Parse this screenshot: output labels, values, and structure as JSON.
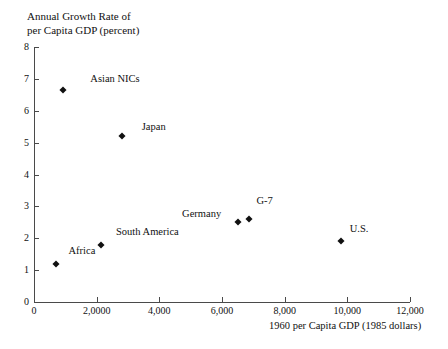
{
  "chart_data": {
    "type": "scatter",
    "title": "",
    "xlabel": "1960 per Capita GDP (1985 dollars)",
    "ylabel": "Annual Growth Rate of\nper Capita GDP (percent)",
    "xlim": [
      0,
      12000
    ],
    "ylim": [
      0,
      8
    ],
    "grid": false,
    "legend": "none",
    "xticks": [
      {
        "value": 0,
        "label": "0"
      },
      {
        "value": 2000,
        "label": "2,0000"
      },
      {
        "value": 4000,
        "label": "4,000"
      },
      {
        "value": 6000,
        "label": "6,000"
      },
      {
        "value": 8000,
        "label": "8,000"
      },
      {
        "value": 10000,
        "label": "10,000"
      },
      {
        "value": 12000,
        "label": "12,000"
      }
    ],
    "yticks": [
      {
        "value": 0,
        "label": "0"
      },
      {
        "value": 1,
        "label": "1"
      },
      {
        "value": 2,
        "label": "2"
      },
      {
        "value": 3,
        "label": "3"
      },
      {
        "value": 4,
        "label": "4"
      },
      {
        "value": 5,
        "label": "5"
      },
      {
        "value": 6,
        "label": "6"
      },
      {
        "value": 7,
        "label": "7"
      },
      {
        "value": 8,
        "label": "8"
      }
    ],
    "points": [
      {
        "name": "Asian NICs",
        "x": 925,
        "y": 6.65,
        "label": "Asian NICs",
        "label_dx": 52,
        "label_dy": -12
      },
      {
        "name": "Japan",
        "x": 2800,
        "y": 5.2,
        "label": "Japan",
        "label_dx": 32,
        "label_dy": -10
      },
      {
        "name": "Germany",
        "x": 6500,
        "y": 2.5,
        "label": "Germany",
        "label_dx": -36,
        "label_dy": -9
      },
      {
        "name": "G-7",
        "x": 6850,
        "y": 2.6,
        "label": "G-7",
        "label_dx": 16,
        "label_dy": -19
      },
      {
        "name": "U.S.",
        "x": 9800,
        "y": 1.92,
        "label": "U.S.",
        "label_dx": 18,
        "label_dy": -13
      },
      {
        "name": "South America",
        "x": 2150,
        "y": 1.8,
        "label": "South America",
        "label_dx": 46,
        "label_dy": -14
      },
      {
        "name": "Africa",
        "x": 700,
        "y": 1.2,
        "label": "Africa",
        "label_dx": 26,
        "label_dy": -14
      }
    ]
  }
}
